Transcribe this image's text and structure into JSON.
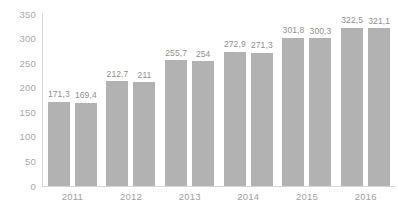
{
  "chart_data": {
    "type": "bar",
    "title": "",
    "subtitle": "",
    "xlabel": "",
    "ylabel": "",
    "categories": [
      "2011",
      "2012",
      "2013",
      "2014",
      "2015",
      "2016"
    ],
    "series": [
      {
        "name": "Series 1",
        "values": [
          171.3,
          212.7,
          255.7,
          272.9,
          301.8,
          322.5
        ],
        "labels": [
          "171,3",
          "212,7",
          "255,7",
          "272,9",
          "301,8",
          "322,5"
        ]
      },
      {
        "name": "Series 2",
        "values": [
          169.4,
          211,
          254,
          271.3,
          300.3,
          321.1
        ],
        "labels": [
          "169,4",
          "211",
          "254",
          "271,3",
          "300,3",
          "321,1"
        ]
      }
    ],
    "ylim": [
      0,
      350
    ],
    "yticks": [
      350,
      300,
      250,
      200,
      150,
      100,
      50,
      0
    ],
    "ytick_labels": [
      "350",
      "300",
      "250",
      "200",
      "150",
      "100",
      "50",
      "0"
    ],
    "grid": false,
    "legend": "none",
    "colors": {
      "bar": "#b2b2b2",
      "axis": "#d5d5d5",
      "tick_text": "#a8a8a8",
      "data_label": "#8f8f8f",
      "background": "#ffffff"
    }
  }
}
